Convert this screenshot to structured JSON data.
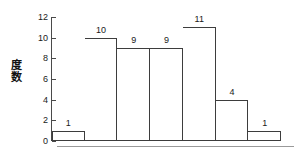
{
  "chart_data": {
    "type": "bar",
    "title": "",
    "subtitle": "",
    "xlabel": "",
    "ylabel": "度数",
    "ylabel_chars": [
      "度",
      "数"
    ],
    "categories": [
      "1",
      "2",
      "3",
      "4",
      "5",
      "6",
      "7"
    ],
    "values": [
      1,
      10,
      9,
      9,
      11,
      4,
      1
    ],
    "data_labels": [
      "1",
      "10",
      "9",
      "9",
      "11",
      "4",
      "1"
    ],
    "ylim": [
      0,
      12
    ],
    "ytick_values": [
      0,
      2,
      4,
      6,
      8,
      10,
      12
    ],
    "ytick_labels": [
      "0",
      "2",
      "4",
      "6",
      "8",
      "10",
      "12"
    ],
    "grid": false,
    "legend": false,
    "legend_position": "none",
    "bar_fill_color": "#ffffff",
    "bar_border_color": "#3d3d3d",
    "axis_color": "#4a4a4a",
    "text_color": "#1a1a1a",
    "background_color": "#ffffff",
    "xtick_labels": []
  }
}
